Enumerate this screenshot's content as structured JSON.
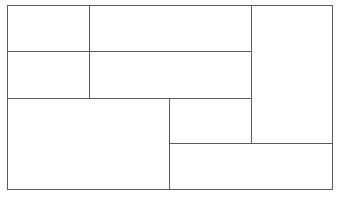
{
  "diagram": {
    "type": "rectangular-panel-grid",
    "background_color": "#ffffff",
    "line_color": "#5a5a5a",
    "line_width_px": 1,
    "canvas": {
      "width": 340,
      "height": 200
    },
    "frame": {
      "x": 7,
      "y": 5,
      "width": 326,
      "height": 185
    },
    "panel_count": 8,
    "panels": [
      {
        "id": "panel-1",
        "label": "",
        "x": 7,
        "y": 5,
        "width": 83,
        "height": 47,
        "row": "top",
        "column": "left"
      },
      {
        "id": "panel-2",
        "label": "",
        "x": 89,
        "y": 5,
        "width": 163,
        "height": 47,
        "row": "top",
        "column": "center"
      },
      {
        "id": "panel-3",
        "label": "",
        "x": 7,
        "y": 51,
        "width": 83,
        "height": 48,
        "row": "middle",
        "column": "left"
      },
      {
        "id": "panel-4",
        "label": "",
        "x": 89,
        "y": 51,
        "width": 163,
        "height": 48,
        "row": "middle",
        "column": "center"
      },
      {
        "id": "panel-5",
        "label": "",
        "x": 251,
        "y": 5,
        "width": 82,
        "height": 139,
        "row": "top-middle-span",
        "column": "right"
      },
      {
        "id": "panel-6",
        "label": "",
        "x": 7,
        "y": 98,
        "width": 163,
        "height": 92,
        "row": "bottom",
        "column": "left"
      },
      {
        "id": "panel-7",
        "label": "",
        "x": 169,
        "y": 98,
        "width": 83,
        "height": 46,
        "row": "bottom",
        "column": "center"
      },
      {
        "id": "panel-8",
        "label": "",
        "x": 169,
        "y": 143,
        "width": 164,
        "height": 47,
        "row": "bottom",
        "column": "center-right"
      }
    ],
    "dividers": {
      "vertical": [
        {
          "id": "divider-v-left",
          "x": 89,
          "y_start": 5,
          "y_end": 98
        },
        {
          "id": "divider-v-center",
          "x": 169,
          "y_start": 98,
          "y_end": 190
        },
        {
          "id": "divider-v-right",
          "x": 251,
          "y_start": 5,
          "y_end": 143
        }
      ],
      "horizontal": [
        {
          "id": "divider-h-upper",
          "y": 51,
          "x_start": 7,
          "x_end": 251
        },
        {
          "id": "divider-h-middle",
          "y": 98,
          "x_start": 7,
          "x_end": 251
        },
        {
          "id": "divider-h-lower",
          "y": 143,
          "x_start": 169,
          "x_end": 333
        }
      ]
    }
  }
}
